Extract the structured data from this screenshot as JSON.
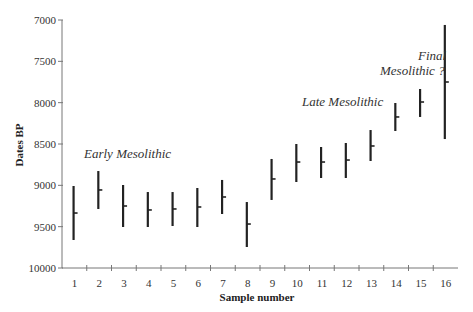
{
  "chart_data": {
    "type": "range",
    "title": "",
    "xlabel": "Sample number",
    "ylabel": "Dates BP",
    "ylim": [
      10000,
      7000
    ],
    "y_inverted": true,
    "y_ticks": [
      7000,
      7500,
      8000,
      8500,
      9000,
      9500,
      10000
    ],
    "categories": [
      "1",
      "2",
      "3",
      "4",
      "5",
      "6",
      "7",
      "8",
      "9",
      "10",
      "11",
      "12",
      "13",
      "14",
      "15",
      "16"
    ],
    "series": [
      {
        "name": "mean",
        "values": [
          9335,
          9056,
          9250,
          9298,
          9286,
          9262,
          9141,
          9468,
          8923,
          8718,
          8718,
          8694,
          8524,
          8173,
          7992,
          7750
        ]
      },
      {
        "name": "upper (younger)",
        "values": [
          9008,
          8827,
          8996,
          9081,
          9081,
          9032,
          8935,
          9202,
          8681,
          8500,
          8536,
          8488,
          8331,
          8004,
          7835,
          7060
        ]
      },
      {
        "name": "lower (older)",
        "values": [
          9661,
          9286,
          9504,
          9504,
          9492,
          9504,
          9347,
          9746,
          9177,
          8960,
          8911,
          8911,
          8706,
          8343,
          8173,
          8440
        ]
      }
    ],
    "annotations": [
      {
        "text": "Early Mesolithic",
        "x": 84,
        "y": 158
      },
      {
        "text": "Late Mesolithic",
        "x": 302,
        "y": 106
      },
      {
        "text": "Final",
        "x": 418,
        "y": 60
      },
      {
        "text": "Mesolithic ?",
        "x": 380,
        "y": 75
      }
    ],
    "grid": false,
    "legend": null
  }
}
